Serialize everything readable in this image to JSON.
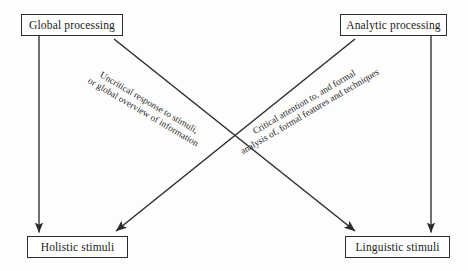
{
  "diagram": {
    "background": "#fdfdfd",
    "stroke_color": "#2b2b2b",
    "text_color": "#1a1a1a",
    "nodes": [
      {
        "id": "global",
        "label": "Global processing",
        "position": "top-left"
      },
      {
        "id": "analytic",
        "label": "Analytic processing",
        "position": "top-right"
      },
      {
        "id": "holistic",
        "label": "Holistic stimuli",
        "position": "bottom-left"
      },
      {
        "id": "linguistic",
        "label": "Linguistic stimuli",
        "position": "bottom-right"
      }
    ],
    "edges": [
      {
        "id": "global-to-holistic",
        "from": "global",
        "to": "holistic",
        "kind": "vertical",
        "arrowhead": "end",
        "label_lines": []
      },
      {
        "id": "analytic-to-linguistic",
        "from": "analytic",
        "to": "linguistic",
        "kind": "vertical",
        "arrowhead": "end",
        "label_lines": []
      },
      {
        "id": "global-to-linguistic",
        "from": "global",
        "to": "linguistic",
        "kind": "diagonal",
        "arrowhead": "end",
        "label_lines": [
          "Uncritical response to stimuli,",
          "or global overview of information"
        ]
      },
      {
        "id": "analytic-to-holistic",
        "from": "analytic",
        "to": "holistic",
        "kind": "diagonal",
        "arrowhead": "end",
        "label_lines": [
          "Critical attention to, and formal",
          "analysis of, formal features and techniques"
        ]
      }
    ],
    "labels": {
      "left_diagonal_line1": "Uncritical response to stimuli,",
      "left_diagonal_line2": "or global overview of information",
      "right_diagonal_line1": "Critical attention to, and formal",
      "right_diagonal_line2": "analysis of, formal features and techniques"
    }
  }
}
